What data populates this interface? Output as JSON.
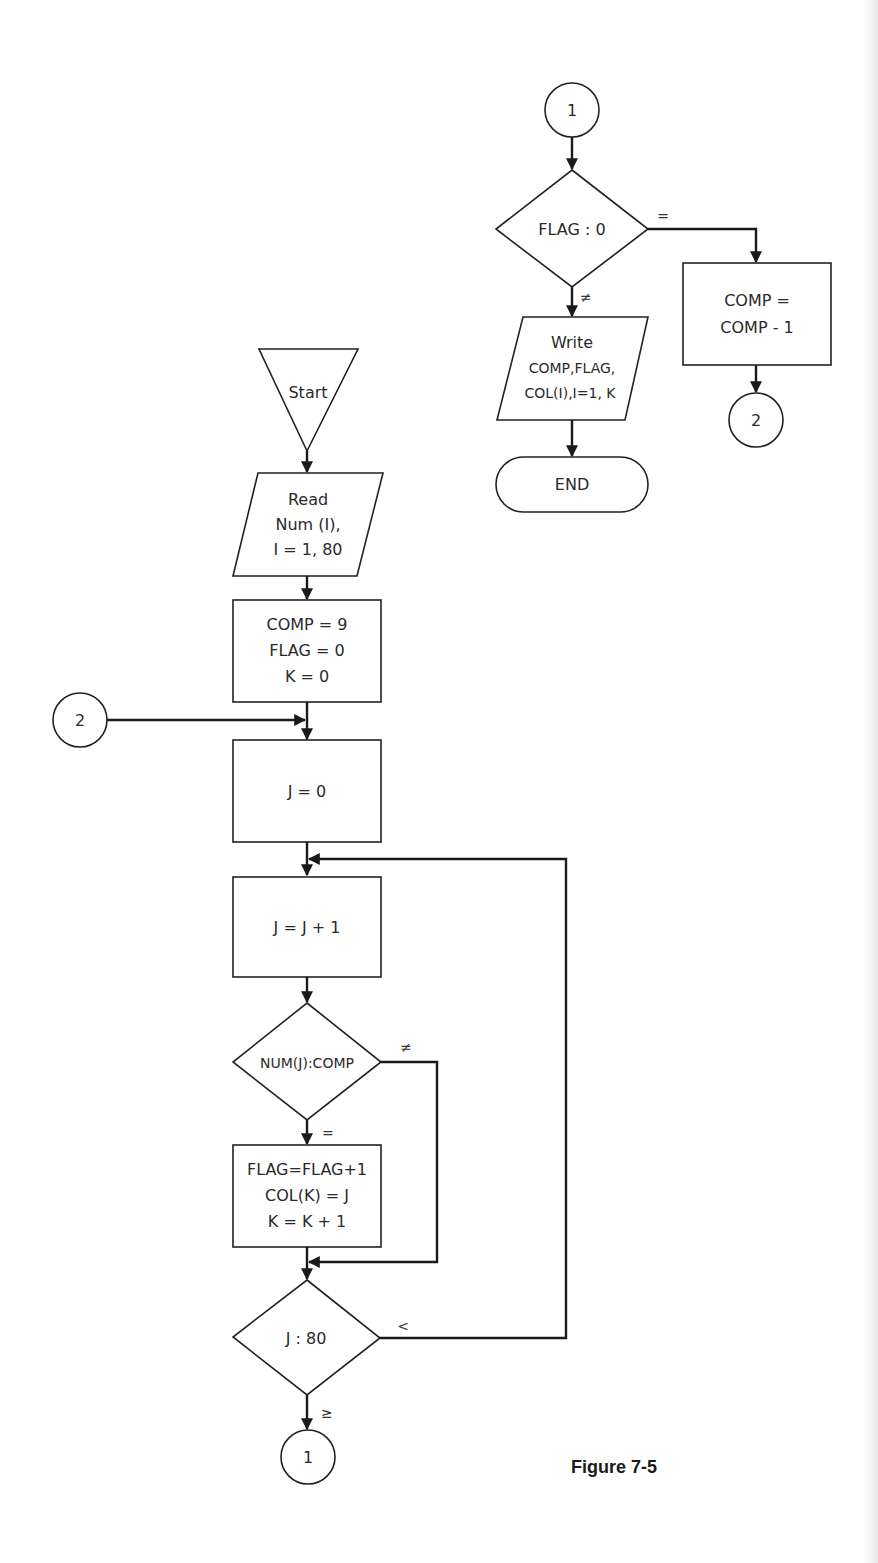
{
  "figure": {
    "caption": "Figure 7-5",
    "colors": {
      "ink": "#1a1a1a",
      "background": "#ffffff"
    }
  },
  "nodes": {
    "start": {
      "type": "terminal-triangle",
      "label": "Start"
    },
    "read": {
      "type": "input-output",
      "lines": [
        "Read",
        "Num (I),",
        "I = 1, 80"
      ]
    },
    "init": {
      "type": "process",
      "lines": [
        "COMP = 9",
        "FLAG = 0",
        "K = 0"
      ]
    },
    "set_j": {
      "type": "process",
      "lines": [
        "J = 0"
      ]
    },
    "inc_j": {
      "type": "process",
      "lines": [
        "J = J + 1"
      ]
    },
    "test_num": {
      "type": "decision",
      "label": "NUM(J):COMP"
    },
    "record": {
      "type": "process",
      "lines": [
        "FLAG=FLAG+1",
        "COL(K) = J",
        "K = K + 1"
      ]
    },
    "test_j": {
      "type": "decision",
      "label": "J : 80"
    },
    "conn_1_out": {
      "type": "connector",
      "label": "1"
    },
    "conn_2_in": {
      "type": "connector",
      "label": "2"
    },
    "conn_1_in": {
      "type": "connector",
      "label": "1"
    },
    "test_flag": {
      "type": "decision",
      "label": "FLAG : 0"
    },
    "write": {
      "type": "input-output",
      "lines": [
        "Write",
        "COMP,FLAG,",
        "COL(I),I=1, K"
      ]
    },
    "end": {
      "type": "terminal",
      "label": "END"
    },
    "dec_comp": {
      "type": "process",
      "lines": [
        "COMP =",
        "COMP - 1"
      ]
    },
    "conn_2_out": {
      "type": "connector",
      "label": "2"
    }
  },
  "edges": {
    "test_num_ne": "≠",
    "test_num_eq": "=",
    "test_j_lt": "<",
    "test_j_ge": "≥",
    "test_flag_eq": "=",
    "test_flag_ne": "≠"
  }
}
